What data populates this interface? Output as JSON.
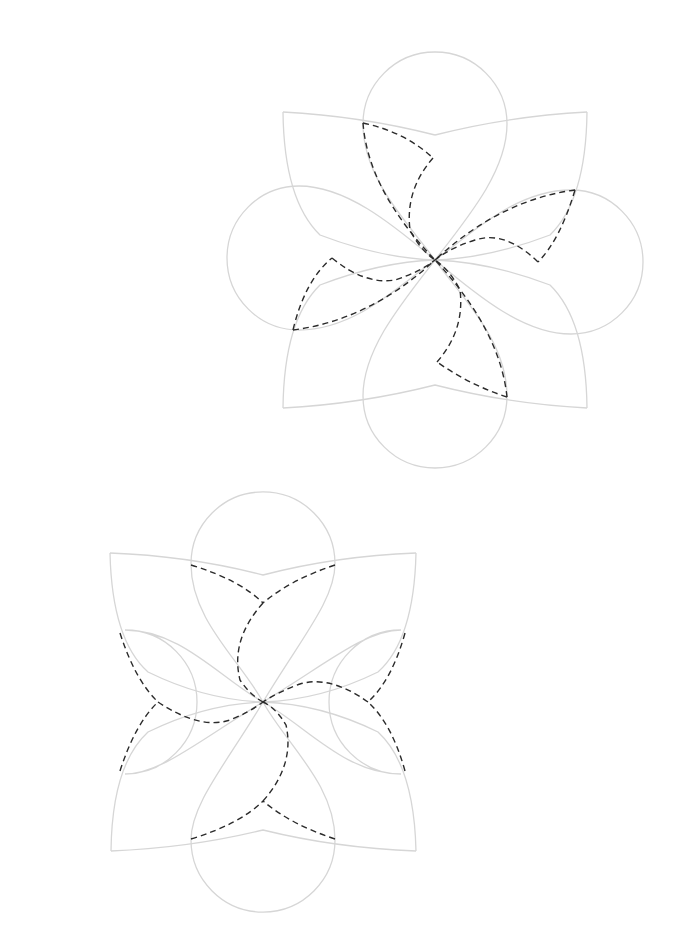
{
  "canvas": {
    "width": 698,
    "height": 939,
    "background": "#ffffff"
  },
  "colors": {
    "outline": "#d6d6d6",
    "dashed": "#2b2b2b"
  },
  "figures": [
    {
      "name": "pinwheel-flower-top",
      "center": [
        435,
        260
      ],
      "outline_paths": [
        "M283,112 Q360,116 435,135 M435,135 Q510,116 587,112",
        "M283,112 Q284,200 320,235 Q380,258 435,260",
        "M587,112 Q586,200 550,235 Q490,258 435,260",
        "M283,408 Q284,320 320,285 Q380,262 435,260",
        "M587,408 Q586,320 550,285 Q490,262 435,260",
        "M283,408 Q360,404 435,385 Q510,404 587,408",
        "M435,260 C410,225 363,180 363,124 A72,72 0 1 1 507,124 C507,170 470,215 435,260",
        "M435,260 C460,295 507,340 507,396 A72,72 0 1 1 363,396 C363,350 400,305 435,260",
        "M435,260 C400,285 355,330 299,330 A72,72 0 1 1 299,186 C345,186 390,222 435,260",
        "M435,260 C470,235 515,190 571,190 A72,72 0 1 1 571,334 C525,334 480,298 435,260"
      ],
      "dashed_paths": [
        "M363,123 Q405,132 433,158",
        "M363,123 Q368,190 435,260",
        "M433,158 Q405,190 410,230 Q420,250 435,260",
        "M575,190 Q500,200 435,260",
        "M575,190 Q560,240 538,262",
        "M538,262 Q505,230 475,240 Q450,248 435,260",
        "M507,397 Q500,330 435,260",
        "M507,397 Q470,385 437,362",
        "M437,362 Q465,330 460,290 Q450,270 435,260",
        "M293,330 Q370,320 435,260",
        "M293,330 Q305,280 332,258",
        "M332,258 Q365,285 395,280 Q420,272 435,260"
      ]
    },
    {
      "name": "clover-flower-bottom",
      "center": [
        263,
        702
      ],
      "outline_paths": [
        "M110,553 Q190,556 263,575 Q336,556 416,553",
        "M110,553 Q112,640 148,672 Q205,700 263,702",
        "M416,553 Q414,640 378,672 Q321,700 263,702",
        "M111,851 Q112,765 148,732 Q205,704 263,702",
        "M416,851 Q414,765 378,732 Q321,704 263,702",
        "M111,851 Q190,848 263,830 Q336,848 416,851",
        "M263,702 C240,660 191,620 191,564 A72,72 0 1 1 335,564 C335,600 300,640 263,702",
        "M263,702 C286,744 335,784 335,840 A72,72 0 1 1 191,840 C191,804 226,764 263,702",
        "M263,702 C221,679 181,630 125,630 A72,72 0 1 1 125,774 C161,774 201,739 263,702",
        "M263,702 C305,725 345,774 401,774 A72,72 0 1 1 401,630 C365,630 325,665 263,702"
      ],
      "dashed_paths": [
        "M191,565 Q240,580 263,603",
        "M335,565 Q290,580 263,603",
        "M263,603 Q230,640 240,680 Q250,695 263,702",
        "M120,633 Q135,680 158,702",
        "M120,771 Q135,724 158,702",
        "M158,702 Q200,730 230,720 Q250,712 263,702",
        "M405,633 Q392,680 368,702",
        "M405,771 Q392,724 368,702",
        "M368,702 Q330,675 300,684 Q278,692 263,702",
        "M191,839 Q240,824 263,801",
        "M335,839 Q290,824 263,801",
        "M263,801 Q295,765 286,725 Q276,708 263,702"
      ]
    }
  ]
}
